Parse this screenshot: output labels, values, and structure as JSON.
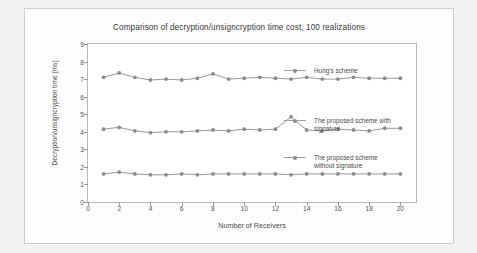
{
  "figure": {
    "title": "Comparison of decryption/unsigncryption time cost, 100 realizations",
    "xlabel": "Number of Receivers",
    "ylabel": "Decryption/unsigncryption time (ms)"
  },
  "chart_data": {
    "type": "line",
    "title": "Comparison of decryption/unsigncryption time cost, 100 realizations",
    "xlabel": "Number of Receivers",
    "ylabel": "Decryption/unsigncryption time (ms)",
    "xlim": [
      0,
      21
    ],
    "ylim": [
      0,
      9
    ],
    "grid": false,
    "legend_position": "inside-right",
    "xticks": [
      0,
      2,
      4,
      6,
      8,
      10,
      12,
      14,
      16,
      18,
      20
    ],
    "yticks": [
      0,
      1,
      2,
      3,
      4,
      5,
      6,
      7,
      8,
      9
    ],
    "x": [
      1,
      2,
      3,
      4,
      5,
      6,
      7,
      8,
      9,
      10,
      11,
      12,
      13,
      14,
      15,
      16,
      17,
      18,
      19,
      20
    ],
    "series": [
      {
        "name": "Hung's scheme",
        "color": "#8c8c8c",
        "values": [
          7.1,
          7.35,
          7.1,
          6.95,
          7.0,
          6.95,
          7.05,
          7.3,
          7.0,
          7.05,
          7.1,
          7.05,
          7.0,
          7.1,
          7.0,
          7.0,
          7.1,
          7.05,
          7.05,
          7.05
        ]
      },
      {
        "name": "The proposed scheme with signature",
        "color": "#8c8c8c",
        "values": [
          4.15,
          4.25,
          4.05,
          3.95,
          4.0,
          4.0,
          4.05,
          4.1,
          4.05,
          4.15,
          4.1,
          4.15,
          4.85,
          4.1,
          4.05,
          4.15,
          4.1,
          4.05,
          4.2,
          4.2
        ]
      },
      {
        "name": "The proposed scheme without signature",
        "color": "#8c8c8c",
        "values": [
          1.6,
          1.7,
          1.6,
          1.55,
          1.55,
          1.6,
          1.55,
          1.6,
          1.6,
          1.6,
          1.6,
          1.6,
          1.55,
          1.6,
          1.6,
          1.6,
          1.6,
          1.6,
          1.6,
          1.6
        ]
      }
    ],
    "legend_labels": [
      "Hung's scheme",
      "The proposed scheme with\nsignature",
      "The proposed scheme\nwithout signature"
    ]
  }
}
